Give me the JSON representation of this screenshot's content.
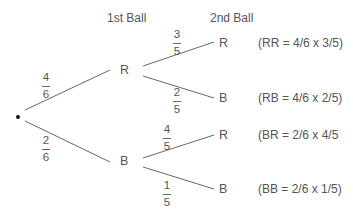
{
  "headers": {
    "first": "1st Ball",
    "second": "2nd Ball"
  },
  "tree": {
    "root": {
      "symbol": "•"
    },
    "level1": [
      {
        "label": "R",
        "prob_num": "4",
        "prob_den": "6"
      },
      {
        "label": "B",
        "prob_num": "2",
        "prob_den": "6"
      }
    ],
    "level2": [
      {
        "parent": "R",
        "label": "R",
        "prob_num": "3",
        "prob_den": "5",
        "outcome": "(RR = 4/6 x 3/5)"
      },
      {
        "parent": "R",
        "label": "B",
        "prob_num": "2",
        "prob_den": "5",
        "outcome": "(RB = 4/6 x 2/5)"
      },
      {
        "parent": "B",
        "label": "R",
        "prob_num": "4",
        "prob_den": "5",
        "outcome": "(BR = 2/6 x 4/5"
      },
      {
        "parent": "B",
        "label": "B",
        "prob_num": "1",
        "prob_den": "5",
        "outcome": "(BB = 2/6 x 1/5)"
      }
    ]
  },
  "colors": {
    "line": "#666666",
    "text": "#555555",
    "dot": "#111111"
  }
}
